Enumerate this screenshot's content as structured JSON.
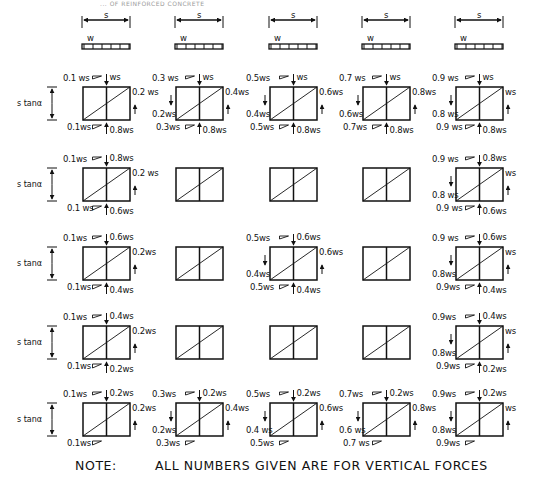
{
  "header": {
    "clipped_title": "... OF REINFORCED CONCRETE"
  },
  "beam_labels": {
    "span": "s",
    "load": "w"
  },
  "row_label": "s tanα",
  "note": {
    "prefix": "NOTE:",
    "text": "ALL NUMBERS GIVEN ARE FOR VERTICAL FORCES"
  },
  "columns": [
    {
      "id": "col1",
      "rows": [
        {
          "top_left": "0.1 ws",
          "top_right": "ws",
          "right": "0.2 ws",
          "left": "",
          "bottom_left": "0.1ws",
          "bottom_right": "0.8ws"
        },
        {
          "top_left": "0.1ws",
          "top_right": "0.8ws",
          "right": "0.2 ws",
          "left": "",
          "bottom_left": "0.1 ws",
          "bottom_right": "0.6ws"
        },
        {
          "top_left": "0.1ws",
          "top_right": "0.6ws",
          "right": "0.2ws",
          "left": "",
          "bottom_left": "0.1ws",
          "bottom_right": "0.4ws"
        },
        {
          "top_left": "0.1ws",
          "top_right": "0.4ws",
          "right": "0.2ws",
          "left": "",
          "bottom_left": "0.1ws",
          "bottom_right": "0.2ws"
        },
        {
          "top_left": "0.1ws",
          "top_right": "0.2ws",
          "right": "0.2ws",
          "left": "",
          "bottom_left": "0.1ws",
          "bottom_right": ""
        }
      ]
    },
    {
      "id": "col2",
      "rows": [
        {
          "top_left": "0.3 ws",
          "top_right": "ws",
          "right": "0.4ws",
          "left": "0.2ws",
          "bottom_left": "0.3ws",
          "bottom_right": "0.8ws"
        },
        {
          "top_left": "",
          "top_right": "",
          "right": "",
          "left": "",
          "bottom_left": "",
          "bottom_right": ""
        },
        {
          "top_left": "",
          "top_right": "",
          "right": "",
          "left": "",
          "bottom_left": "",
          "bottom_right": ""
        },
        {
          "top_left": "",
          "top_right": "",
          "right": "",
          "left": "",
          "bottom_left": "",
          "bottom_right": ""
        },
        {
          "top_left": "0.3ws",
          "top_right": "0.2ws",
          "right": "0.4ws",
          "left": "0.2ws",
          "bottom_left": "0.3ws",
          "bottom_right": ""
        }
      ]
    },
    {
      "id": "col3",
      "rows": [
        {
          "top_left": "0.5ws",
          "top_right": "ws",
          "right": "0.6ws",
          "left": "0.4ws",
          "bottom_left": "0.5ws",
          "bottom_right": "0.8ws"
        },
        {
          "top_left": "",
          "top_right": "",
          "right": "",
          "left": "",
          "bottom_left": "",
          "bottom_right": ""
        },
        {
          "top_left": "0.5ws",
          "top_right": "0.6ws",
          "right": "0.6ws",
          "left": "0.4ws",
          "bottom_left": "0.5ws",
          "bottom_right": "0.4ws"
        },
        {
          "top_left": "",
          "top_right": "",
          "right": "",
          "left": "",
          "bottom_left": "",
          "bottom_right": ""
        },
        {
          "top_left": "0.5ws",
          "top_right": "0.2ws",
          "right": "0.6ws",
          "left": "0.4 ws",
          "bottom_left": "0.5ws",
          "bottom_right": ""
        }
      ]
    },
    {
      "id": "col4",
      "rows": [
        {
          "top_left": "0.7 ws",
          "top_right": "ws",
          "right": "0.8ws",
          "left": "0.6ws",
          "bottom_left": "0.7ws",
          "bottom_right": "0.8ws"
        },
        {
          "top_left": "",
          "top_right": "",
          "right": "",
          "left": "",
          "bottom_left": "",
          "bottom_right": ""
        },
        {
          "top_left": "",
          "top_right": "",
          "right": "",
          "left": "",
          "bottom_left": "",
          "bottom_right": ""
        },
        {
          "top_left": "",
          "top_right": "",
          "right": "",
          "left": "",
          "bottom_left": "",
          "bottom_right": ""
        },
        {
          "top_left": "0.7ws",
          "top_right": "0.2ws",
          "right": "0.8ws",
          "left": "0.6 ws",
          "bottom_left": "0.7 ws",
          "bottom_right": ""
        }
      ]
    },
    {
      "id": "col5",
      "rows": [
        {
          "top_left": "0.9 ws",
          "top_right": "ws",
          "right": "ws",
          "left": "0.8 ws",
          "bottom_left": "0.9 ws",
          "bottom_right": "0.8ws"
        },
        {
          "top_left": "0.9 ws",
          "top_right": "0.8ws",
          "right": "ws",
          "left": "0.8 ws",
          "bottom_left": "0.9 ws",
          "bottom_right": "0.6ws"
        },
        {
          "top_left": "0.9 ws",
          "top_right": "0.6ws",
          "right": "ws",
          "left": "0.8ws",
          "bottom_left": "0.9ws",
          "bottom_right": "0.4ws"
        },
        {
          "top_left": "0.9ws",
          "top_right": "0.4ws",
          "right": "ws",
          "left": "0.8ws",
          "bottom_left": "0.9ws",
          "bottom_right": "0.2ws"
        },
        {
          "top_left": "0.9ws",
          "top_right": "0.2ws",
          "right": "ws",
          "left": "0.8ws",
          "bottom_left": "0.9ws",
          "bottom_right": ""
        }
      ]
    }
  ]
}
